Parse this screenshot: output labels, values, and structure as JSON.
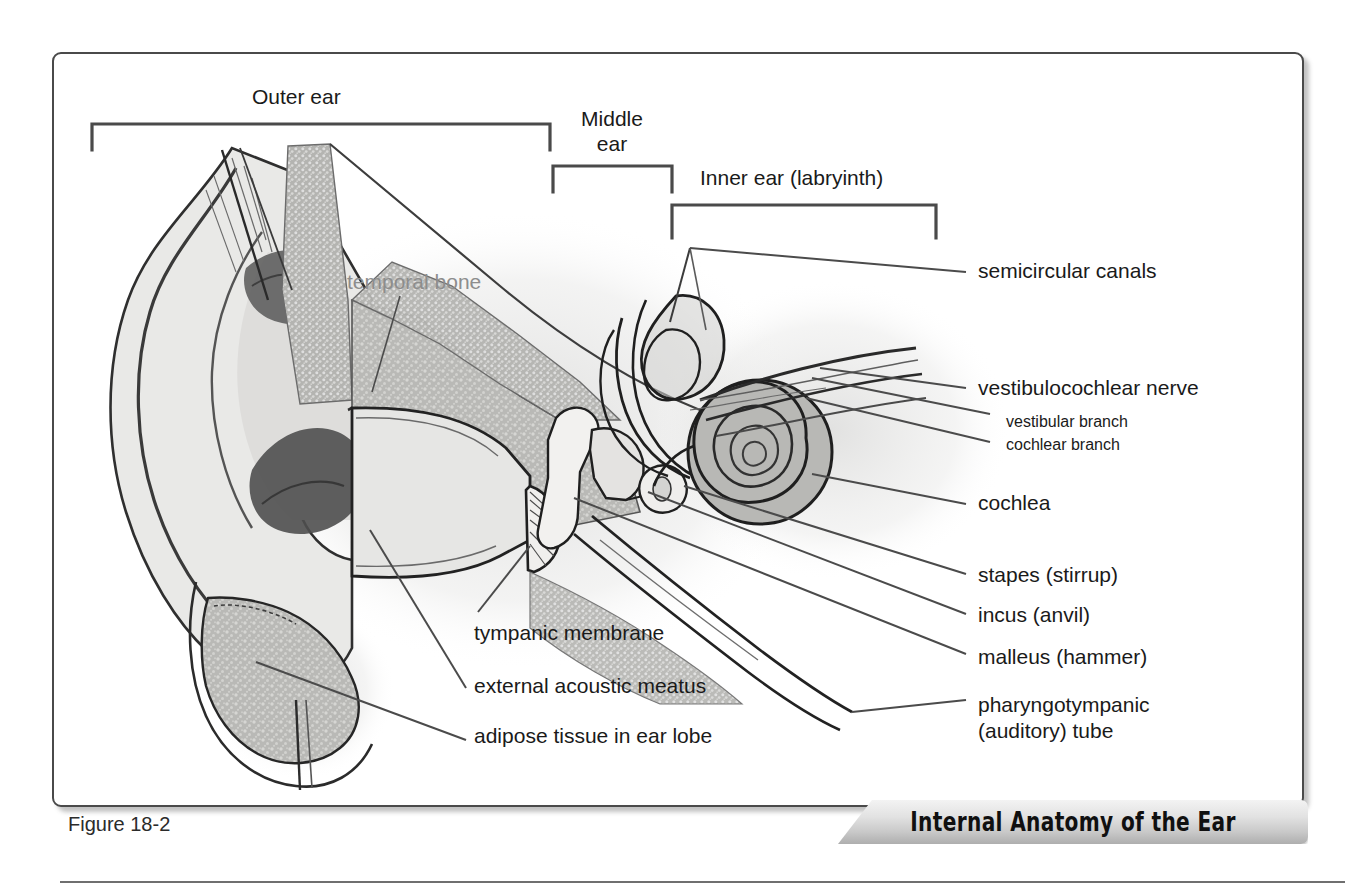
{
  "figure": {
    "caption": "Figure 18-2",
    "banner_title": "Internal Anatomy of the Ear",
    "frame_border_color": "#4a4a4a",
    "background_color": "#ffffff"
  },
  "region_brackets": [
    {
      "id": "outer-ear",
      "label": "Outer ear"
    },
    {
      "id": "middle-ear",
      "label": "Middle\near"
    },
    {
      "id": "inner-ear",
      "label": "Inner ear (labryinth)"
    }
  ],
  "brackets_plain": {
    "outer": "Outer ear",
    "middle_line1": "Middle",
    "middle_line2": "ear",
    "inner": "Inner ear (labryinth)"
  },
  "labels": {
    "temporal_bone": "temporal bone",
    "semicircular_canals": "semicircular canals",
    "vestibulocochlear_nerve": "vestibulocochlear nerve",
    "vestibular_branch": "vestibular branch",
    "cochlear_branch": "cochlear branch",
    "cochlea": "cochlea",
    "stapes": "stapes (stirrup)",
    "incus": "incus (anvil)",
    "malleus": "malleus (hammer)",
    "pharyngotympanic_line1": "pharyngotympanic",
    "pharyngotympanic_line2": "(auditory) tube",
    "tympanic_membrane": "tympanic membrane",
    "external_acoustic_meatus": "external acoustic meatus",
    "adipose_tissue": "adipose tissue in ear lobe"
  },
  "colors": {
    "ink": "#1a1a1a",
    "leader_line": "#4b4b4b",
    "temporal_bone_text": "#8d8d8d",
    "tissue_light": "#e8e8e6",
    "tissue_mid": "#c2c2c0",
    "tissue_dark": "#9a9a98",
    "shadow": "#d8d8d6"
  }
}
